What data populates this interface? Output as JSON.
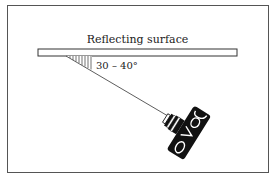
{
  "diagram": {
    "surface_label": "Reflecting surface",
    "angle_label": "30 – 40°",
    "elements": [
      "reflecting-surface-bar",
      "angle-hatch",
      "sight-line",
      "camera"
    ]
  }
}
